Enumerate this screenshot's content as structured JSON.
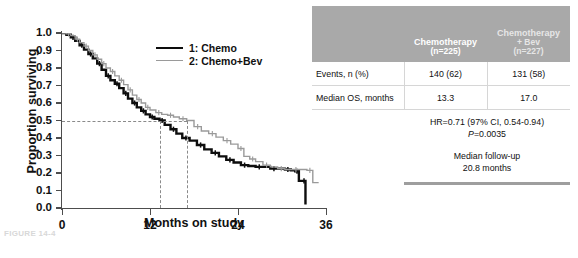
{
  "figure": {
    "caption": "FIGURE 14-4"
  },
  "chart_data": {
    "type": "line",
    "subtype": "kaplan-meier-survival",
    "title": "",
    "xlabel": "Months on study",
    "ylabel": "Proportion surviving",
    "xlim": [
      0,
      36
    ],
    "ylim": [
      0.0,
      1.0
    ],
    "x_ticks": [
      0,
      12,
      24,
      36
    ],
    "x_tick_labels": [
      "0",
      "12",
      "24",
      "36"
    ],
    "y_ticks": [
      0.0,
      0.1,
      0.2,
      0.3,
      0.4,
      0.5,
      0.6,
      0.7,
      0.8,
      0.9,
      1.0
    ],
    "y_tick_labels": [
      "0.0",
      "0.1",
      "0.2",
      "0.3",
      "0.4",
      "0.5",
      "0.6",
      "0.7",
      "0.8",
      "0.9",
      "1.0"
    ],
    "grid": false,
    "legend_position": "upper-center",
    "annotations": [
      {
        "name": "median-reference-horizontal",
        "type": "hline",
        "y": 0.5,
        "style": "dashed"
      },
      {
        "name": "median-reference-chemo",
        "type": "vline",
        "x": 13.3,
        "style": "dashed"
      },
      {
        "name": "median-reference-chemo-bev",
        "type": "vline",
        "x": 17.0,
        "style": "dashed"
      }
    ],
    "series": [
      {
        "name": "1: Chemo",
        "color": "#0d0d0d",
        "line_width": 2.4,
        "median_survival_months": 13.3,
        "x": [
          0,
          0.6,
          1.2,
          1.8,
          2.4,
          3.0,
          3.6,
          4.2,
          4.8,
          5.4,
          6.0,
          6.6,
          7.2,
          7.8,
          8.4,
          9.0,
          9.6,
          10.2,
          10.8,
          11.4,
          12.0,
          12.6,
          13.3,
          14.0,
          14.8,
          15.6,
          16.4,
          17.4,
          18.4,
          19.4,
          20.4,
          21.4,
          22.4,
          23.4,
          24.4,
          25.4,
          26.4,
          27.4,
          28.4,
          29.4,
          30.4,
          31.2,
          31.8,
          32.3,
          32.8,
          33.2
        ],
        "y": [
          1.0,
          0.99,
          0.975,
          0.955,
          0.93,
          0.905,
          0.88,
          0.855,
          0.825,
          0.79,
          0.755,
          0.73,
          0.71,
          0.685,
          0.655,
          0.625,
          0.6,
          0.575,
          0.555,
          0.535,
          0.52,
          0.51,
          0.5,
          0.475,
          0.45,
          0.425,
          0.4,
          0.385,
          0.36,
          0.335,
          0.315,
          0.295,
          0.275,
          0.26,
          0.245,
          0.24,
          0.235,
          0.235,
          0.225,
          0.225,
          0.22,
          0.215,
          0.21,
          0.155,
          0.155,
          0.02
        ]
      },
      {
        "name": "2: Chemo+Bev",
        "color": "#9a9a9a",
        "line_width": 1.4,
        "median_survival_months": 17.0,
        "x": [
          0,
          0.6,
          1.2,
          1.8,
          2.4,
          3.0,
          3.6,
          4.2,
          4.8,
          5.4,
          6.0,
          6.6,
          7.2,
          7.8,
          8.4,
          9.0,
          9.6,
          10.2,
          10.8,
          11.4,
          12.0,
          12.8,
          13.6,
          14.4,
          15.2,
          16.0,
          17.0,
          18.0,
          19.0,
          20.0,
          21.0,
          22.0,
          23.0,
          24.0,
          24.8,
          25.6,
          26.4,
          27.4,
          28.4,
          29.4,
          30.4,
          31.4,
          32.4,
          33.4,
          34.2,
          35.0
        ],
        "y": [
          1.0,
          0.995,
          0.985,
          0.965,
          0.945,
          0.925,
          0.9,
          0.875,
          0.85,
          0.825,
          0.8,
          0.78,
          0.755,
          0.73,
          0.705,
          0.675,
          0.645,
          0.62,
          0.6,
          0.575,
          0.56,
          0.545,
          0.535,
          0.53,
          0.52,
          0.51,
          0.5,
          0.465,
          0.44,
          0.425,
          0.405,
          0.385,
          0.365,
          0.34,
          0.295,
          0.28,
          0.265,
          0.245,
          0.235,
          0.225,
          0.22,
          0.22,
          0.22,
          0.215,
          0.145,
          0.145
        ]
      }
    ],
    "legend": [
      {
        "label": "1: Chemo",
        "marker": "bold-line",
        "color": "#0d0d0d"
      },
      {
        "label": "2: Chemo+Bev",
        "marker": "thin-line",
        "color": "#9a9a9a"
      }
    ]
  },
  "results_table": {
    "headers": {
      "blank": "",
      "arm_a": {
        "name": "Chemotherapy",
        "n": "(n=225)"
      },
      "arm_b": {
        "name": "Chemotherapy + Bev",
        "name_line1": "Chemotherapy",
        "name_line2": "+ Bev",
        "n": "(n=227)"
      }
    },
    "rows": [
      {
        "label": "Events, n (%)",
        "arm_a": "140 (62)",
        "arm_b": "131 (58)"
      },
      {
        "label": "Median OS, months",
        "arm_a": "13.3",
        "arm_b": "17.0"
      }
    ],
    "stats": {
      "hazard_ratio": "HR=0.71 (97% CI, 0.54-0.94)",
      "p_prefix": "P",
      "p_value": "=0.0035"
    },
    "followup": {
      "label": "Median follow-up",
      "value": "20.8 months"
    }
  },
  "colors": {
    "header_gray": "#a9a9a9",
    "header_black": "#0a0a0a",
    "series_chemo": "#0d0d0d",
    "series_chemo_bev": "#9a9a9a",
    "rule_gray": "#9e9e9e"
  }
}
